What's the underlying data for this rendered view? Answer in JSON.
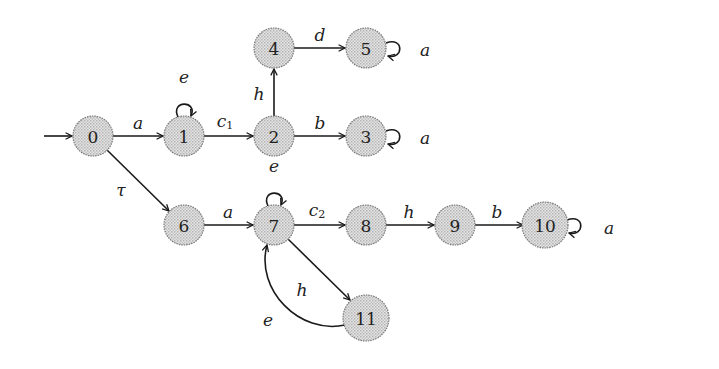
{
  "diagram": {
    "type": "automaton / labelled transition system",
    "initial_state": "0",
    "nodes": [
      {
        "id": "0",
        "label": "0",
        "x": 93,
        "y": 136
      },
      {
        "id": "1",
        "label": "1",
        "x": 184,
        "y": 136
      },
      {
        "id": "2",
        "label": "2",
        "x": 274,
        "y": 136
      },
      {
        "id": "3",
        "label": "3",
        "x": 366,
        "y": 136
      },
      {
        "id": "4",
        "label": "4",
        "x": 274,
        "y": 48
      },
      {
        "id": "5",
        "label": "5",
        "x": 366,
        "y": 48
      },
      {
        "id": "6",
        "label": "6",
        "x": 184,
        "y": 225
      },
      {
        "id": "7",
        "label": "7",
        "x": 274,
        "y": 225
      },
      {
        "id": "8",
        "label": "8",
        "x": 366,
        "y": 225
      },
      {
        "id": "9",
        "label": "9",
        "x": 455,
        "y": 225
      },
      {
        "id": "10",
        "label": "10",
        "x": 545,
        "y": 225
      },
      {
        "id": "11",
        "label": "11",
        "x": 366,
        "y": 315
      }
    ],
    "edges": [
      {
        "from": "0",
        "to": "1",
        "label": "a"
      },
      {
        "from": "1",
        "to": "1",
        "label": "e"
      },
      {
        "from": "1",
        "to": "2",
        "label": "c",
        "subscript": "1"
      },
      {
        "from": "2",
        "to": "4",
        "label": "h"
      },
      {
        "from": "4",
        "to": "5",
        "label": "d"
      },
      {
        "from": "5",
        "to": "5",
        "label": "a"
      },
      {
        "from": "2",
        "to": "3",
        "label": "b"
      },
      {
        "from": "3",
        "to": "3",
        "label": "a"
      },
      {
        "from": "0",
        "to": "6",
        "label": "τ"
      },
      {
        "from": "6",
        "to": "7",
        "label": "a"
      },
      {
        "from": "7",
        "to": "7",
        "label": "e"
      },
      {
        "from": "7",
        "to": "8",
        "label": "c",
        "subscript": "2"
      },
      {
        "from": "8",
        "to": "9",
        "label": "h"
      },
      {
        "from": "9",
        "to": "10",
        "label": "b"
      },
      {
        "from": "10",
        "to": "10",
        "label": "a"
      },
      {
        "from": "7",
        "to": "11",
        "label": "h"
      },
      {
        "from": "11",
        "to": "7",
        "label": "e"
      }
    ]
  }
}
